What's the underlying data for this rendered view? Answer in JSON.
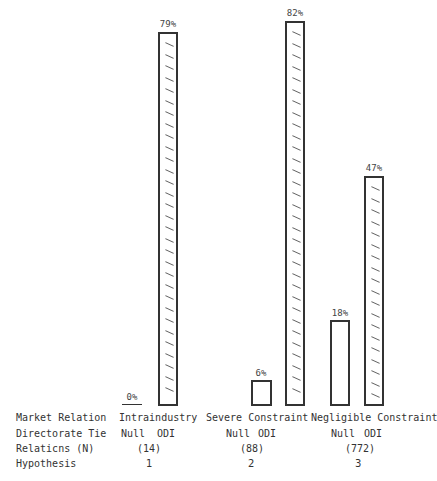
{
  "chart_data": {
    "type": "bar",
    "title": "",
    "categories": [
      "Intraindustry",
      "Severe Constraint",
      "Negligible Constraint"
    ],
    "series": [
      {
        "name": "Null",
        "values": [
          0,
          6,
          18
        ]
      },
      {
        "name": "ODI",
        "values": [
          79,
          82,
          47
        ]
      }
    ],
    "value_labels": {
      "Null": [
        "0%",
        "6%",
        "18%"
      ],
      "ODI": [
        "79%",
        "82%",
        "47%"
      ]
    },
    "relations_n": [
      "(14)",
      "(88)",
      "(772)"
    ],
    "hypothesis": [
      "1",
      "2",
      "3"
    ],
    "xlabel": "",
    "ylabel": "",
    "ylim": [
      0,
      100
    ],
    "grid": false,
    "legend": "none",
    "odi_fill": "diagonal hatch marks",
    "null_fill": "empty"
  },
  "rows": {
    "market_relation": "Market Relation",
    "directorate_tie": "Directorate Tie",
    "relations_n": "Relaticns (N)",
    "hypothesis": "Hypothesis"
  },
  "groups": [
    {
      "market": "Intraindustry",
      "null": "Null",
      "odi": "ODI",
      "n": "(14)",
      "hyp": "1",
      "null_pct": "0%",
      "odi_pct": "79%"
    },
    {
      "market": "Severe Constraint",
      "null": "Null",
      "odi": "ODI",
      "n": "(88)",
      "hyp": "2",
      "null_pct": "6%",
      "odi_pct": "82%"
    },
    {
      "market": "Negligible Constraint",
      "null": "Null",
      "odi": "ODI",
      "n": "(772)",
      "hyp": "3",
      "null_pct": "18%",
      "odi_pct": "47%"
    }
  ]
}
